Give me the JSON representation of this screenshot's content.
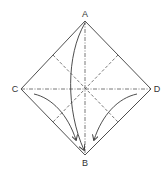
{
  "diagram": {
    "type": "origami-fold-instruction",
    "labels": {
      "top": "A",
      "bottom": "B",
      "left": "C",
      "right": "D"
    },
    "colors": {
      "line": "#3a3a3a",
      "background": "#ffffff"
    },
    "shape": "square rotated 45° (diamond)",
    "crease_lines": [
      "vertical A–B (dash-dot valley fold)",
      "horizontal C–D (dash-dot valley fold)",
      "diagonal upper-left edge midpoint to lower-right edge midpoint (dashed)",
      "diagonal upper-right edge midpoint to lower-left edge midpoint (dashed)"
    ],
    "arrows": [
      "curved arrow from A down to B",
      "curved arrow from C toward B",
      "curved arrow from D toward B"
    ]
  }
}
